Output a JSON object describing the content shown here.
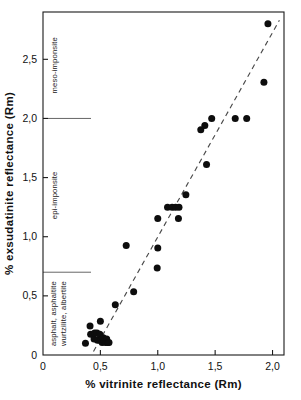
{
  "chart_data": {
    "type": "scatter",
    "title": "",
    "xlabel": "% vitrinite  reflectance (Rm)",
    "ylabel": "% exsudatinite  reflectance (Rm)",
    "xlim": [
      0,
      2.1
    ],
    "ylim": [
      0,
      2.9
    ],
    "grid": false,
    "legend": "none",
    "xticks": [
      0,
      0.5,
      1.0,
      1.5,
      2.0
    ],
    "xticklabels": [
      "0",
      "0,5",
      "1,0",
      "1,5",
      "2,0"
    ],
    "yticks": [
      0.5,
      1.0,
      1.5,
      2.0,
      2.5
    ],
    "yticklabels": [
      "0,5",
      "1,0",
      "1,5",
      "2,0",
      "2,5"
    ],
    "y_origin_label": "0",
    "points": [
      {
        "x": 0.37,
        "y": 0.1
      },
      {
        "x": 0.41,
        "y": 0.245
      },
      {
        "x": 0.415,
        "y": 0.175
      },
      {
        "x": 0.445,
        "y": 0.135
      },
      {
        "x": 0.45,
        "y": 0.185
      },
      {
        "x": 0.47,
        "y": 0.185
      },
      {
        "x": 0.475,
        "y": 0.125
      },
      {
        "x": 0.495,
        "y": 0.175
      },
      {
        "x": 0.5,
        "y": 0.285
      },
      {
        "x": 0.505,
        "y": 0.125
      },
      {
        "x": 0.515,
        "y": 0.105
      },
      {
        "x": 0.525,
        "y": 0.145
      },
      {
        "x": 0.535,
        "y": 0.115
      },
      {
        "x": 0.545,
        "y": 0.105
      },
      {
        "x": 0.555,
        "y": 0.135
      },
      {
        "x": 0.565,
        "y": 0.105
      },
      {
        "x": 0.575,
        "y": 0.105
      },
      {
        "x": 0.63,
        "y": 0.425
      },
      {
        "x": 0.725,
        "y": 0.925
      },
      {
        "x": 0.79,
        "y": 0.535
      },
      {
        "x": 0.995,
        "y": 0.735
      },
      {
        "x": 1.0,
        "y": 0.905
      },
      {
        "x": 1.0,
        "y": 1.155
      },
      {
        "x": 1.085,
        "y": 1.25
      },
      {
        "x": 1.125,
        "y": 1.25
      },
      {
        "x": 1.155,
        "y": 1.25
      },
      {
        "x": 1.18,
        "y": 1.155
      },
      {
        "x": 1.185,
        "y": 1.25
      },
      {
        "x": 1.245,
        "y": 1.355
      },
      {
        "x": 1.375,
        "y": 1.905
      },
      {
        "x": 1.41,
        "y": 1.94
      },
      {
        "x": 1.425,
        "y": 1.61
      },
      {
        "x": 1.47,
        "y": 2.0
      },
      {
        "x": 1.675,
        "y": 2.0
      },
      {
        "x": 1.775,
        "y": 2.0
      },
      {
        "x": 1.925,
        "y": 2.305
      },
      {
        "x": 1.96,
        "y": 2.8
      }
    ],
    "trend_line": {
      "style": "dashed",
      "x_start": 0.44,
      "y_start": 0.03,
      "x_end": 2.06,
      "y_end": 2.83
    },
    "zones": [
      {
        "label": "meso-imponsite",
        "y_min": 2.0,
        "y_max": 2.9
      },
      {
        "label": "epi-imponsite",
        "y_min": 0.7,
        "y_max": 2.0
      },
      {
        "label": "asphalt, asphaltite",
        "label2": "wurtzilite, albertite",
        "y_min": 0.0,
        "y_max": 0.7
      }
    ],
    "zone_dividers": [
      2.0,
      0.7
    ],
    "colors": {
      "point": "#0d0d0d",
      "axis": "#1a1a1a",
      "trend": "#4a4a4a",
      "divider": "#555555",
      "background": "#ffffff"
    }
  }
}
